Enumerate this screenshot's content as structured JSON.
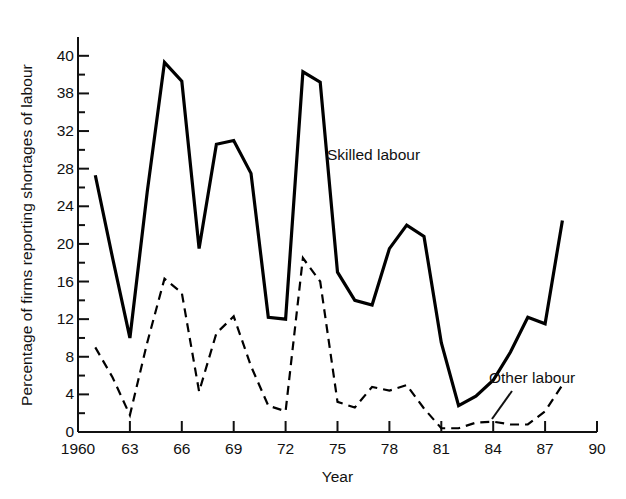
{
  "chart_data": {
    "type": "line",
    "title": "",
    "xlabel": "Year",
    "ylabel": "Percentage of firms reporting shortages of labour",
    "xlim": [
      1960,
      1990
    ],
    "ylim": [
      0,
      42
    ],
    "grid": false,
    "legend_position": "inline-annotation",
    "x_ticks": [
      1960,
      1963,
      1966,
      1969,
      1972,
      1975,
      1978,
      1981,
      1984,
      1987,
      1990
    ],
    "x_tick_labels": [
      "1960",
      "63",
      "66",
      "69",
      "72",
      "75",
      "78",
      "81",
      "84",
      "87",
      "90"
    ],
    "x_minor_tick_interval": 1,
    "y_ticks": [
      0,
      4,
      8,
      12,
      16,
      20,
      24,
      28,
      32,
      36,
      40
    ],
    "y_tick_labels": [
      "0",
      "4",
      "8",
      "12",
      "16",
      "20",
      "24",
      "28",
      "32",
      "38",
      "40"
    ],
    "y_minor_tick_interval": 2,
    "series": [
      {
        "name": "Skilled labour",
        "style": "solid",
        "color": "#000000",
        "linewidth": 3.2,
        "annotation": "Skilled labour",
        "x": [
          1961,
          1962,
          1963,
          1964,
          1965,
          1966,
          1967,
          1968,
          1969,
          1970,
          1971,
          1972,
          1973,
          1974,
          1975,
          1976,
          1977,
          1978,
          1979,
          1980,
          1981,
          1982,
          1983,
          1984,
          1985,
          1986,
          1987,
          1988
        ],
        "values": [
          27.3,
          18.5,
          10.0,
          25.5,
          39.3,
          37.3,
          19.5,
          30.6,
          31.0,
          27.5,
          12.2,
          12.0,
          38.3,
          37.2,
          17.0,
          14.0,
          13.5,
          19.5,
          22.0,
          20.8,
          9.5,
          2.8,
          3.8,
          5.5,
          8.5,
          12.2,
          11.5,
          22.5
        ]
      },
      {
        "name": "Other labour",
        "style": "dashed",
        "color": "#000000",
        "linewidth": 2.2,
        "annotation": "Other labour",
        "x": [
          1961,
          1962,
          1963,
          1964,
          1965,
          1966,
          1967,
          1968,
          1969,
          1970,
          1971,
          1972,
          1973,
          1974,
          1975,
          1976,
          1977,
          1978,
          1979,
          1980,
          1981,
          1982,
          1983,
          1984,
          1985,
          1986,
          1987,
          1988
        ],
        "values": [
          9.0,
          5.8,
          1.8,
          9.5,
          16.3,
          14.8,
          4.3,
          10.5,
          12.3,
          7.0,
          2.8,
          2.2,
          18.5,
          16.0,
          3.2,
          2.6,
          4.8,
          4.4,
          5.0,
          2.5,
          0.4,
          0.4,
          1.0,
          1.1,
          0.8,
          0.8,
          2.2,
          5.0
        ]
      }
    ],
    "annotations": [
      {
        "text": "Skilled labour",
        "x_px": 327,
        "y_px": 146,
        "leader_line": false
      },
      {
        "text": "Other labour",
        "x_px": 489,
        "y_px": 369,
        "leader_line": true
      }
    ]
  }
}
